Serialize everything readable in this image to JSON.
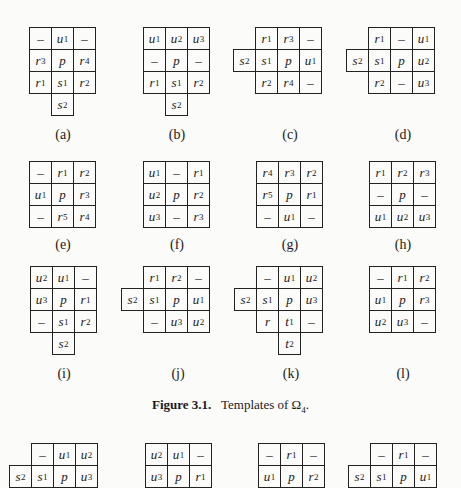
{
  "figure": {
    "label": "Figure 3.1.",
    "text": "Templates of Ω",
    "subscript": "4",
    "end": "."
  },
  "templates": [
    {
      "id": "a",
      "caption": "(a)",
      "x": 29,
      "y": 27,
      "capx": 29,
      "capy": 127,
      "cells": [
        [
          0,
          0,
          "–"
        ],
        [
          1,
          0,
          "u1"
        ],
        [
          2,
          0,
          "–"
        ],
        [
          0,
          1,
          "r3"
        ],
        [
          1,
          1,
          "p"
        ],
        [
          2,
          1,
          "r4"
        ],
        [
          0,
          2,
          "r1"
        ],
        [
          1,
          2,
          "s1"
        ],
        [
          2,
          2,
          "r2"
        ],
        [
          1,
          3,
          "s2"
        ]
      ]
    },
    {
      "id": "b",
      "caption": "(b)",
      "x": 143,
      "y": 27,
      "capx": 143,
      "capy": 127,
      "cells": [
        [
          0,
          0,
          "u1"
        ],
        [
          1,
          0,
          "u2"
        ],
        [
          2,
          0,
          "u3"
        ],
        [
          0,
          1,
          "–"
        ],
        [
          1,
          1,
          "p"
        ],
        [
          2,
          1,
          "–"
        ],
        [
          0,
          2,
          "r1"
        ],
        [
          1,
          2,
          "s1"
        ],
        [
          2,
          2,
          "r2"
        ],
        [
          1,
          3,
          "s2"
        ]
      ]
    },
    {
      "id": "c",
      "caption": "(c)",
      "x": 233,
      "y": 27,
      "capx": 256,
      "capy": 127,
      "cells": [
        [
          1,
          0,
          "r1"
        ],
        [
          2,
          0,
          "r3"
        ],
        [
          3,
          0,
          "–"
        ],
        [
          0,
          1,
          "s2"
        ],
        [
          1,
          1,
          "s1"
        ],
        [
          2,
          1,
          "p"
        ],
        [
          3,
          1,
          "u1"
        ],
        [
          1,
          2,
          "r2"
        ],
        [
          2,
          2,
          "r4"
        ],
        [
          3,
          2,
          "–"
        ]
      ]
    },
    {
      "id": "d",
      "caption": "(d)",
      "x": 346,
      "y": 27,
      "capx": 369,
      "capy": 127,
      "cells": [
        [
          1,
          0,
          "r1"
        ],
        [
          2,
          0,
          "–"
        ],
        [
          3,
          0,
          "u1"
        ],
        [
          0,
          1,
          "s2"
        ],
        [
          1,
          1,
          "s1"
        ],
        [
          2,
          1,
          "p"
        ],
        [
          3,
          1,
          "u2"
        ],
        [
          1,
          2,
          "r2"
        ],
        [
          2,
          2,
          "–"
        ],
        [
          3,
          2,
          "u3"
        ]
      ]
    },
    {
      "id": "e",
      "caption": "(e)",
      "x": 29,
      "y": 161,
      "capx": 29,
      "capy": 237,
      "cells": [
        [
          0,
          0,
          "–"
        ],
        [
          1,
          0,
          "r1"
        ],
        [
          2,
          0,
          "r2"
        ],
        [
          0,
          1,
          "u1"
        ],
        [
          1,
          1,
          "p"
        ],
        [
          2,
          1,
          "r3"
        ],
        [
          0,
          2,
          "–"
        ],
        [
          1,
          2,
          "r5"
        ],
        [
          2,
          2,
          "r4"
        ]
      ]
    },
    {
      "id": "f",
      "caption": "(f)",
      "x": 143,
      "y": 161,
      "capx": 143,
      "capy": 237,
      "cells": [
        [
          0,
          0,
          "u1"
        ],
        [
          1,
          0,
          "–"
        ],
        [
          2,
          0,
          "r1"
        ],
        [
          0,
          1,
          "u2"
        ],
        [
          1,
          1,
          "p"
        ],
        [
          2,
          1,
          "r2"
        ],
        [
          0,
          2,
          "u3"
        ],
        [
          1,
          2,
          "–"
        ],
        [
          2,
          2,
          "r3"
        ]
      ]
    },
    {
      "id": "g",
      "caption": "(g)",
      "x": 256,
      "y": 161,
      "capx": 256,
      "capy": 237,
      "cells": [
        [
          0,
          0,
          "r4"
        ],
        [
          1,
          0,
          "r3"
        ],
        [
          2,
          0,
          "r2"
        ],
        [
          0,
          1,
          "r5"
        ],
        [
          1,
          1,
          "p"
        ],
        [
          2,
          1,
          "r1"
        ],
        [
          0,
          2,
          "–"
        ],
        [
          1,
          2,
          "u1"
        ],
        [
          2,
          2,
          "–"
        ]
      ]
    },
    {
      "id": "h",
      "caption": "(h)",
      "x": 369,
      "y": 161,
      "capx": 369,
      "capy": 237,
      "cells": [
        [
          0,
          0,
          "r1"
        ],
        [
          1,
          0,
          "r2"
        ],
        [
          2,
          0,
          "r3"
        ],
        [
          0,
          1,
          "–"
        ],
        [
          1,
          1,
          "p"
        ],
        [
          2,
          1,
          "–"
        ],
        [
          0,
          2,
          "u1"
        ],
        [
          1,
          2,
          "u2"
        ],
        [
          2,
          2,
          "u3"
        ]
      ]
    },
    {
      "id": "i",
      "caption": "(i)",
      "x": 30,
      "y": 266,
      "capx": 30,
      "capy": 366,
      "cells": [
        [
          0,
          0,
          "u2"
        ],
        [
          1,
          0,
          "u1"
        ],
        [
          2,
          0,
          "–"
        ],
        [
          0,
          1,
          "u3"
        ],
        [
          1,
          1,
          "p"
        ],
        [
          2,
          1,
          "r1"
        ],
        [
          0,
          2,
          "–"
        ],
        [
          1,
          2,
          "s1"
        ],
        [
          2,
          2,
          "r2"
        ],
        [
          1,
          3,
          "s2"
        ]
      ]
    },
    {
      "id": "j",
      "caption": "(j)",
      "x": 121,
      "y": 266,
      "capx": 144,
      "capy": 366,
      "cells": [
        [
          1,
          0,
          "r1"
        ],
        [
          2,
          0,
          "r2"
        ],
        [
          3,
          0,
          "–"
        ],
        [
          0,
          1,
          "s2"
        ],
        [
          1,
          1,
          "s1"
        ],
        [
          2,
          1,
          "p"
        ],
        [
          3,
          1,
          "u1"
        ],
        [
          1,
          2,
          "–"
        ],
        [
          2,
          2,
          "u3"
        ],
        [
          3,
          2,
          "u2"
        ]
      ]
    },
    {
      "id": "k",
      "caption": "(k)",
      "x": 234,
      "y": 266,
      "capx": 257,
      "capy": 366,
      "cells": [
        [
          1,
          0,
          "–"
        ],
        [
          2,
          0,
          "u1"
        ],
        [
          3,
          0,
          "u2"
        ],
        [
          0,
          1,
          "s2"
        ],
        [
          1,
          1,
          "s1"
        ],
        [
          2,
          1,
          "p"
        ],
        [
          3,
          1,
          "u3"
        ],
        [
          1,
          2,
          "r"
        ],
        [
          2,
          2,
          "t1"
        ],
        [
          3,
          2,
          "–"
        ],
        [
          2,
          3,
          "t2"
        ]
      ]
    },
    {
      "id": "l",
      "caption": "(l)",
      "x": 369,
      "y": 266,
      "capx": 369,
      "capy": 366,
      "cells": [
        [
          0,
          0,
          "–"
        ],
        [
          1,
          0,
          "r1"
        ],
        [
          2,
          0,
          "r2"
        ],
        [
          0,
          1,
          "u1"
        ],
        [
          1,
          1,
          "p"
        ],
        [
          2,
          1,
          "r3"
        ],
        [
          0,
          2,
          "u2"
        ],
        [
          1,
          2,
          "u3"
        ],
        [
          2,
          2,
          "–"
        ]
      ]
    },
    {
      "id": "m",
      "caption": "",
      "x": 9,
      "y": 443,
      "cells": [
        [
          1,
          0,
          "–"
        ],
        [
          2,
          0,
          "u1"
        ],
        [
          3,
          0,
          "u2"
        ],
        [
          0,
          1,
          "s2"
        ],
        [
          1,
          1,
          "s1"
        ],
        [
          2,
          1,
          "p"
        ],
        [
          3,
          1,
          "u3"
        ]
      ]
    },
    {
      "id": "n",
      "caption": "",
      "x": 145,
      "y": 443,
      "cells": [
        [
          0,
          0,
          "u2"
        ],
        [
          1,
          0,
          "u1"
        ],
        [
          2,
          0,
          "–"
        ],
        [
          0,
          1,
          "u3"
        ],
        [
          1,
          1,
          "p"
        ],
        [
          2,
          1,
          "r1"
        ]
      ]
    },
    {
      "id": "o",
      "caption": "",
      "x": 258,
      "y": 443,
      "cells": [
        [
          0,
          0,
          "–"
        ],
        [
          1,
          0,
          "r1"
        ],
        [
          2,
          0,
          "–"
        ],
        [
          0,
          1,
          "u1"
        ],
        [
          1,
          1,
          "p"
        ],
        [
          2,
          1,
          "r2"
        ]
      ]
    },
    {
      "id": "p",
      "caption": "",
      "x": 348,
      "y": 443,
      "cells": [
        [
          1,
          0,
          "–"
        ],
        [
          2,
          0,
          "r1"
        ],
        [
          3,
          0,
          "–"
        ],
        [
          0,
          1,
          "s2"
        ],
        [
          1,
          1,
          "s1"
        ],
        [
          2,
          1,
          "p"
        ],
        [
          3,
          1,
          "u1"
        ]
      ]
    }
  ]
}
